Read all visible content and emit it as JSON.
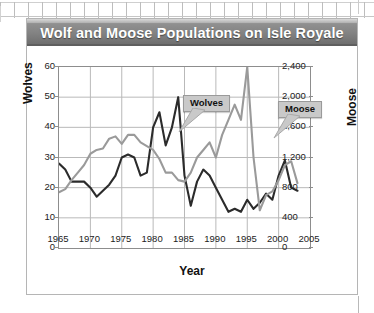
{
  "card": {
    "title": "Wolf and Moose Populations on Isle Royale"
  },
  "decor": {
    "top_fence": "ruler-fence-pattern",
    "right_rule": "page-margin-rule"
  },
  "chart_data": {
    "type": "line",
    "title": "Wolf and Moose Populations on Isle Royale",
    "xlabel": "Year",
    "ylabel": "Wolves",
    "y2label": "Moose",
    "grid": true,
    "legend": "annotations",
    "xlim": [
      1965,
      2005
    ],
    "xticks": [
      1965,
      1970,
      1975,
      1980,
      1985,
      1990,
      1995,
      2000,
      2005
    ],
    "ylim": [
      0,
      60
    ],
    "yticks": [
      0,
      10,
      20,
      30,
      40,
      50,
      60
    ],
    "y2lim": [
      0,
      2400
    ],
    "y2ticks": [
      "0",
      "400",
      "800",
      "1,200",
      "1,600",
      "2,000",
      "2,400"
    ],
    "y2ticks_numeric": [
      0,
      400,
      800,
      1200,
      1600,
      2000,
      2400
    ],
    "annotations": [
      {
        "label": "Wolves",
        "points_to_series": "Wolves"
      },
      {
        "label": "Moose",
        "points_to_series": "Moose"
      }
    ],
    "x": [
      1965,
      1966,
      1967,
      1968,
      1969,
      1970,
      1971,
      1972,
      1973,
      1974,
      1975,
      1976,
      1977,
      1978,
      1979,
      1980,
      1981,
      1982,
      1983,
      1984,
      1985,
      1986,
      1987,
      1988,
      1989,
      1990,
      1991,
      1992,
      1993,
      1994,
      1995,
      1996,
      1997,
      1998,
      1999,
      2000,
      2001,
      2002,
      2003
    ],
    "series": [
      {
        "name": "Wolves",
        "axis": "left",
        "color": "#2b2b2b",
        "values": [
          28,
          26,
          22,
          22,
          22,
          20,
          17,
          19,
          21,
          24,
          30,
          31,
          30,
          24,
          25,
          40,
          45,
          34,
          40,
          50,
          24,
          14,
          22,
          26,
          24,
          20,
          16,
          12,
          13,
          12,
          16,
          13,
          15,
          18,
          16,
          24,
          29,
          20,
          19
        ]
      },
      {
        "name": "Moose",
        "axis": "right",
        "color": "#9a9a9a",
        "values": [
          740,
          780,
          900,
          1000,
          1100,
          1250,
          1300,
          1320,
          1450,
          1480,
          1380,
          1500,
          1500,
          1400,
          1350,
          1300,
          1180,
          1000,
          1000,
          900,
          880,
          1000,
          1200,
          1300,
          1400,
          1200,
          1500,
          1700,
          1900,
          1700,
          2400,
          1200,
          500,
          700,
          750,
          900,
          1100,
          1150,
          860
        ]
      }
    ]
  }
}
